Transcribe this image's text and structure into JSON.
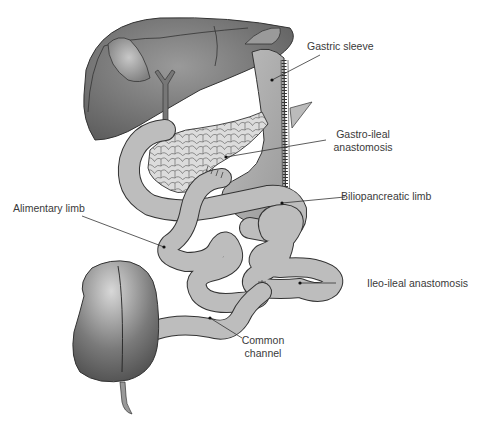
{
  "diagram": {
    "colors": {
      "liver": "#6e6e6e",
      "gallbladder": "#9a9a9a",
      "stomach": "#a8a8a8",
      "pancreas": "#d9d9d9",
      "bowel": "#bdbdbd",
      "cecum": "#7a7a7a",
      "outline": "#3a3a3a",
      "label": "#3a3a3a"
    },
    "labels": {
      "gastric_sleeve": "Gastric sleeve",
      "gastro_ileal_line1": "Gastro-ileal",
      "gastro_ileal_line2": "anastomosis",
      "biliopancreatic_limb": "Biliopancreatic limb",
      "alimentary_limb": "Alimentary limb",
      "ileo_ileal_anastomosis": "Ileo-ileal anastomosis",
      "common_channel_line1": "Common",
      "common_channel_line2": "channel"
    }
  }
}
